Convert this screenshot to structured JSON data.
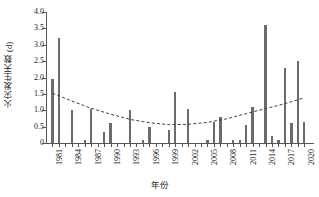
{
  "chart_data": {
    "type": "bar",
    "title": "",
    "xlabel": "年份",
    "ylabel": "火灾发生天数 (d)",
    "ylim": [
      0,
      4.0
    ],
    "yticks": [
      "0",
      "0.5",
      "1.0",
      "1.5",
      "2.0",
      "2.5",
      "3.0",
      "3.5",
      "4.0"
    ],
    "ytick_values": [
      0,
      0.5,
      1.0,
      1.5,
      2.0,
      2.5,
      3.0,
      3.5,
      4.0
    ],
    "grid": false,
    "legend": null,
    "bar_color": "#6b6b6b",
    "trend_color": "#3f3f3f",
    "trend_style": "dashed",
    "categories": [
      "1981",
      "1982",
      "1983",
      "1984",
      "1985",
      "1986",
      "1987",
      "1988",
      "1989",
      "1990",
      "1991",
      "1992",
      "1993",
      "1994",
      "1995",
      "1996",
      "1997",
      "1998",
      "1999",
      "2000",
      "2001",
      "2002",
      "2003",
      "2004",
      "2005",
      "2006",
      "2007",
      "2008",
      "2009",
      "2010",
      "2011",
      "2012",
      "2013",
      "2014",
      "2015",
      "2016",
      "2017",
      "2018",
      "2019",
      "2020"
    ],
    "values": [
      1.95,
      3.2,
      0.0,
      1.0,
      0.0,
      0.1,
      1.05,
      0.0,
      0.35,
      0.6,
      0.0,
      0.0,
      1.0,
      0.0,
      0.1,
      0.5,
      0.0,
      0.0,
      0.4,
      1.55,
      0.0,
      1.05,
      0.0,
      0.0,
      0.1,
      0.65,
      0.8,
      0.0,
      0.1,
      0.1,
      0.55,
      1.1,
      0.0,
      3.6,
      0.2,
      0.1,
      2.3,
      0.6,
      2.5,
      0.65
    ],
    "xtick_labels": [
      "1981",
      "1984",
      "1987",
      "1990",
      "1993",
      "1996",
      "1999",
      "2002",
      "2005",
      "2008",
      "2011",
      "2014",
      "2017",
      "2020"
    ],
    "trend": {
      "type": "polynomial",
      "order": 2,
      "points": [
        {
          "x": 1981,
          "y": 1.52
        },
        {
          "x": 1984,
          "y": 1.28
        },
        {
          "x": 1987,
          "y": 1.06
        },
        {
          "x": 1990,
          "y": 0.88
        },
        {
          "x": 1993,
          "y": 0.72
        },
        {
          "x": 1996,
          "y": 0.62
        },
        {
          "x": 1999,
          "y": 0.56
        },
        {
          "x": 2002,
          "y": 0.57
        },
        {
          "x": 2005,
          "y": 0.63
        },
        {
          "x": 2008,
          "y": 0.74
        },
        {
          "x": 2011,
          "y": 0.9
        },
        {
          "x": 2014,
          "y": 1.05
        },
        {
          "x": 2017,
          "y": 1.2
        },
        {
          "x": 2020,
          "y": 1.38
        }
      ]
    }
  }
}
